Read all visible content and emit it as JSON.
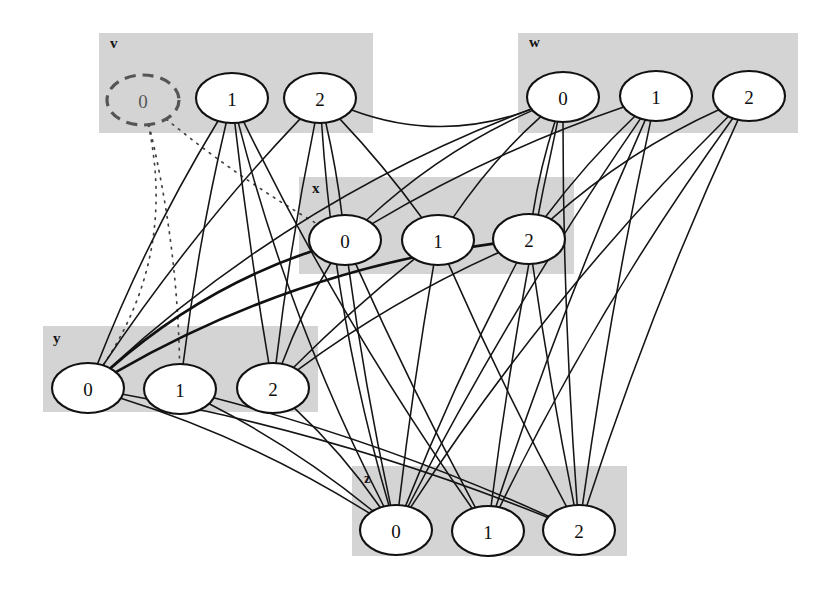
{
  "figure": {
    "width": 829,
    "height": 597,
    "background": "#ffffff",
    "band_color": "#d4d4d4",
    "edge_color": "#151515",
    "node_fill": "#ffffff",
    "node_stroke": "#111111",
    "pruned_stroke": "#555555"
  },
  "groups": [
    {
      "id": "v",
      "label": "v",
      "label_pos": {
        "x": 110,
        "y": 48
      },
      "band": {
        "x": 99,
        "y": 33,
        "w": 274,
        "h": 100
      },
      "nodes": [
        {
          "id": "v0",
          "label": "0",
          "cx": 143,
          "cy": 100,
          "rx": 36,
          "ry": 25,
          "state": "pruned"
        },
        {
          "id": "v1",
          "label": "1",
          "cx": 232,
          "cy": 98,
          "rx": 36,
          "ry": 25,
          "state": "active"
        },
        {
          "id": "v2",
          "label": "2",
          "cx": 320,
          "cy": 98,
          "rx": 36,
          "ry": 25,
          "state": "active"
        }
      ]
    },
    {
      "id": "w",
      "label": "w",
      "label_pos": {
        "x": 529,
        "y": 47
      },
      "band": {
        "x": 518,
        "y": 33,
        "w": 280,
        "h": 100
      },
      "nodes": [
        {
          "id": "w0",
          "label": "0",
          "cx": 563,
          "cy": 97,
          "rx": 36,
          "ry": 25,
          "state": "active"
        },
        {
          "id": "w1",
          "label": "1",
          "cx": 656,
          "cy": 96,
          "rx": 36,
          "ry": 25,
          "state": "active"
        },
        {
          "id": "w2",
          "label": "2",
          "cx": 749,
          "cy": 96,
          "rx": 36,
          "ry": 25,
          "state": "active"
        }
      ]
    },
    {
      "id": "x",
      "label": "x",
      "label_pos": {
        "x": 312,
        "y": 193
      },
      "band": {
        "x": 299,
        "y": 177,
        "w": 275,
        "h": 97
      },
      "nodes": [
        {
          "id": "x0",
          "label": "0",
          "cx": 345,
          "cy": 240,
          "rx": 36,
          "ry": 25,
          "state": "active"
        },
        {
          "id": "x1",
          "label": "1",
          "cx": 438,
          "cy": 240,
          "rx": 36,
          "ry": 25,
          "state": "active"
        },
        {
          "id": "x2",
          "label": "2",
          "cx": 529,
          "cy": 239,
          "rx": 36,
          "ry": 25,
          "state": "active"
        }
      ]
    },
    {
      "id": "y",
      "label": "y",
      "label_pos": {
        "x": 53,
        "y": 343
      },
      "band": {
        "x": 43,
        "y": 326,
        "w": 275,
        "h": 86
      },
      "nodes": [
        {
          "id": "y0",
          "label": "0",
          "cx": 88,
          "cy": 388,
          "rx": 36,
          "ry": 25,
          "state": "active"
        },
        {
          "id": "y1",
          "label": "1",
          "cx": 180,
          "cy": 389,
          "rx": 36,
          "ry": 25,
          "state": "active"
        },
        {
          "id": "y2",
          "label": "2",
          "cx": 273,
          "cy": 388,
          "rx": 36,
          "ry": 25,
          "state": "active"
        }
      ]
    },
    {
      "id": "z",
      "label": "z",
      "label_pos": {
        "x": 364,
        "y": 483
      },
      "band": {
        "x": 352,
        "y": 466,
        "w": 275,
        "h": 90
      },
      "nodes": [
        {
          "id": "z0",
          "label": "0",
          "cx": 396,
          "cy": 530,
          "rx": 36,
          "ry": 25,
          "state": "active"
        },
        {
          "id": "z1",
          "label": "1",
          "cx": 488,
          "cy": 531,
          "rx": 36,
          "ry": 25,
          "state": "active"
        },
        {
          "id": "z2",
          "label": "2",
          "cx": 579,
          "cy": 530,
          "rx": 36,
          "ry": 25,
          "state": "active"
        }
      ]
    }
  ],
  "edges": [
    {
      "from": "v0",
      "to": "y0",
      "style": "dotted",
      "bow": -62
    },
    {
      "from": "v0",
      "to": "y1",
      "style": "dotted",
      "bow": -16
    },
    {
      "from": "v0",
      "to": "x0",
      "style": "dotted",
      "bow": 10
    },
    {
      "from": "v1",
      "to": "y0",
      "style": "solid",
      "bow": 14
    },
    {
      "from": "v1",
      "to": "y1",
      "style": "solid",
      "bow": 8
    },
    {
      "from": "v1",
      "to": "y2",
      "style": "solid",
      "bow": 4
    },
    {
      "from": "v1",
      "to": "z0",
      "style": "solid",
      "bow": 26
    },
    {
      "from": "v1",
      "to": "z1",
      "style": "solid",
      "bow": 20
    },
    {
      "from": "v2",
      "to": "y0",
      "style": "solid",
      "bow": 16
    },
    {
      "from": "v2",
      "to": "y2",
      "style": "solid",
      "bow": 6
    },
    {
      "from": "v2",
      "to": "x0",
      "style": "solid",
      "bow": -4
    },
    {
      "from": "v2",
      "to": "x1",
      "style": "solid",
      "bow": -6
    },
    {
      "from": "v2",
      "to": "z0",
      "style": "solid",
      "bow": 24
    },
    {
      "from": "v2",
      "to": "w0",
      "style": "solid",
      "bow": 46
    },
    {
      "from": "w0",
      "to": "x0",
      "style": "solid",
      "bow": 22
    },
    {
      "from": "w0",
      "to": "x1",
      "style": "solid",
      "bow": 12
    },
    {
      "from": "w0",
      "to": "x2",
      "style": "solid",
      "bow": 6
    },
    {
      "from": "w0",
      "to": "y0",
      "style": "solid",
      "bow": 54
    },
    {
      "from": "w0",
      "to": "z1",
      "style": "solid",
      "bow": 10
    },
    {
      "from": "w0",
      "to": "z2",
      "style": "solid",
      "bow": 8
    },
    {
      "from": "w1",
      "to": "x0",
      "style": "solid",
      "bow": 18
    },
    {
      "from": "w1",
      "to": "x2",
      "style": "solid",
      "bow": 8
    },
    {
      "from": "w1",
      "to": "z1",
      "style": "solid",
      "bow": 12
    },
    {
      "from": "w1",
      "to": "z2",
      "style": "solid",
      "bow": 8
    },
    {
      "from": "w1",
      "to": "z0",
      "style": "solid",
      "bow": 16
    },
    {
      "from": "w2",
      "to": "z0",
      "style": "solid",
      "bow": 30
    },
    {
      "from": "w2",
      "to": "z1",
      "style": "solid",
      "bow": 22
    },
    {
      "from": "w2",
      "to": "z2",
      "style": "solid",
      "bow": 14
    },
    {
      "from": "w2",
      "to": "x2",
      "style": "solid",
      "bow": 20
    },
    {
      "from": "x0",
      "to": "y0",
      "style": "thick",
      "bow": 30
    },
    {
      "from": "x0",
      "to": "y2",
      "style": "solid",
      "bow": 8
    },
    {
      "from": "x0",
      "to": "z0",
      "style": "solid",
      "bow": 6
    },
    {
      "from": "x0",
      "to": "z1",
      "style": "solid",
      "bow": 6
    },
    {
      "from": "x1",
      "to": "y2",
      "style": "solid",
      "bow": 6
    },
    {
      "from": "x1",
      "to": "z0",
      "style": "solid",
      "bow": 4
    },
    {
      "from": "x1",
      "to": "z2",
      "style": "solid",
      "bow": 6
    },
    {
      "from": "x2",
      "to": "y0",
      "style": "thick",
      "bow": 46
    },
    {
      "from": "x2",
      "to": "y2",
      "style": "solid",
      "bow": 16
    },
    {
      "from": "x2",
      "to": "z0",
      "style": "solid",
      "bow": 8
    },
    {
      "from": "x2",
      "to": "z2",
      "style": "solid",
      "bow": 4
    },
    {
      "from": "y0",
      "to": "z0",
      "style": "solid",
      "bow": -22
    },
    {
      "from": "y0",
      "to": "z2",
      "style": "solid",
      "bow": -26
    },
    {
      "from": "y1",
      "to": "z0",
      "style": "solid",
      "bow": -14
    },
    {
      "from": "y1",
      "to": "z2",
      "style": "solid",
      "bow": -18
    },
    {
      "from": "y2",
      "to": "z0",
      "style": "solid",
      "bow": -10
    }
  ],
  "legend": {
    "pruned_note": "0",
    "group_ids": [
      "v",
      "w",
      "x",
      "y",
      "z"
    ],
    "domain_values": [
      "0",
      "1",
      "2"
    ]
  }
}
